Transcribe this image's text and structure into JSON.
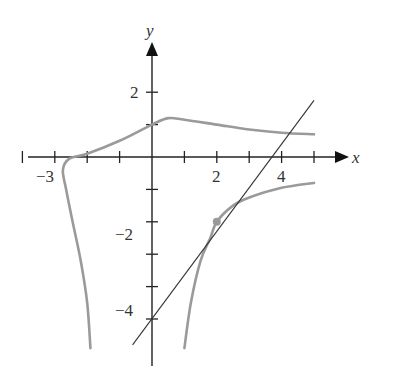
{
  "chart_data": {
    "type": "line",
    "title": "",
    "xlabel": "x",
    "ylabel": "y",
    "xlim": [
      -3.9,
      6.0
    ],
    "ylim": [
      -5.8,
      3.5
    ],
    "grid": false,
    "x_ticks": [
      -4,
      -3,
      -2,
      -1,
      1,
      2,
      3,
      4,
      5
    ],
    "y_ticks": [
      -5,
      -4,
      -3,
      -2,
      -1,
      1,
      2
    ],
    "x_tick_labels": [
      {
        "value": -3,
        "label": "−3"
      },
      {
        "value": 2,
        "label": "2"
      },
      {
        "value": 4,
        "label": "4"
      }
    ],
    "y_tick_labels": [
      {
        "value": 2,
        "label": "2"
      },
      {
        "value": -2,
        "label": "−2"
      },
      {
        "value": -4,
        "label": "−4"
      }
    ],
    "series": [
      {
        "name": "curve-upper-left-branch",
        "color": "#999999",
        "points": [
          [
            -1.9,
            -5.9
          ],
          [
            -2.0,
            -4.5
          ],
          [
            -2.2,
            -3.2
          ],
          [
            -2.45,
            -2.0
          ],
          [
            -2.65,
            -1.0
          ],
          [
            -2.75,
            -0.4
          ],
          [
            -2.55,
            -0.05
          ],
          [
            -2.0,
            0.1
          ],
          [
            -1.0,
            0.5
          ],
          [
            0,
            1.0
          ],
          [
            0.5,
            1.2
          ],
          [
            1.0,
            1.15
          ],
          [
            2.0,
            1.0
          ],
          [
            3.0,
            0.85
          ],
          [
            4.0,
            0.75
          ],
          [
            5.0,
            0.7
          ]
        ]
      },
      {
        "name": "curve-lower-right-branch",
        "color": "#999999",
        "points": [
          [
            1.0,
            -5.9
          ],
          [
            1.2,
            -4.5
          ],
          [
            1.5,
            -3.2
          ],
          [
            1.8,
            -2.5
          ],
          [
            2.0,
            -2.0
          ],
          [
            2.5,
            -1.5
          ],
          [
            3.0,
            -1.25
          ],
          [
            4.0,
            -0.95
          ],
          [
            5.0,
            -0.8
          ]
        ]
      },
      {
        "name": "tangent-line",
        "color": "#333333",
        "points": [
          [
            -0.6,
            -5.8
          ],
          [
            5.0,
            1.75
          ]
        ]
      }
    ],
    "annotations": [
      {
        "type": "point",
        "x": 2,
        "y": -2,
        "color": "#999999",
        "label": "point of tangency"
      }
    ]
  },
  "labels": {
    "x_axis": "x",
    "y_axis": "y",
    "tick_neg3": "−3",
    "tick_2x": "2",
    "tick_4x": "4",
    "tick_2y": "2",
    "tick_neg2y": "−2",
    "tick_neg4y": "−4"
  }
}
